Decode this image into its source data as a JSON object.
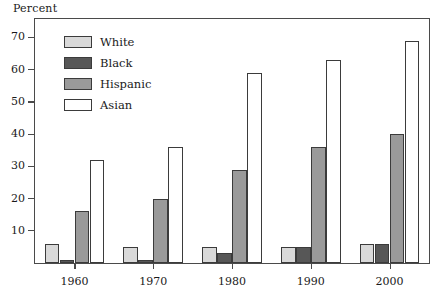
{
  "chart_data": {
    "type": "bar",
    "title": "",
    "subtitle": "",
    "xlabel": "",
    "ylabel": "Percent",
    "categories": [
      "1960",
      "1970",
      "1980",
      "1990",
      "2000"
    ],
    "series": [
      {
        "name": "White",
        "values": [
          6,
          5,
          5,
          5,
          6
        ],
        "color": "#d9d9d9"
      },
      {
        "name": "Black",
        "values": [
          1,
          1,
          3,
          5,
          6
        ],
        "color": "#575757"
      },
      {
        "name": "Hispanic",
        "values": [
          16,
          20,
          29,
          36,
          40
        ],
        "color": "#9a9a9a"
      },
      {
        "name": "Asian",
        "values": [
          32,
          36,
          59,
          63,
          69
        ],
        "color": "#ffffff"
      }
    ],
    "ylim": [
      0,
      76
    ],
    "yticks": [
      10,
      20,
      30,
      40,
      50,
      60,
      70
    ],
    "ytick_labels": [
      "10",
      "20",
      "30",
      "40",
      "50",
      "60",
      "70"
    ],
    "grid": false,
    "legend_position": "top-left",
    "legend_entries": [
      "White",
      "Black",
      "Hispanic",
      "Asian"
    ]
  },
  "axis": {
    "y_title": "Percent"
  },
  "colors": {
    "frame": "#4a4a4a",
    "bar_outline": "#3b3b3b",
    "text": "#1a1a1a",
    "background": "#ffffff"
  }
}
